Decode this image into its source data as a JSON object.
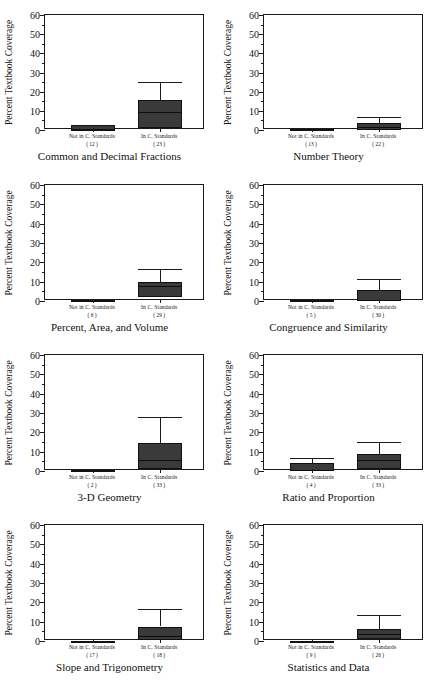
{
  "figure": {
    "axis_title_y": "Percent Textbook Coverage",
    "y_ticks": [
      0,
      10,
      20,
      30,
      40,
      50,
      60
    ],
    "y_min": 0,
    "y_max": 60,
    "category_labels": [
      "Not in C. Standards",
      "In C. Standards"
    ]
  },
  "chart_data": {
    "type": "box",
    "title": "",
    "xlabel": "",
    "ylabel": "Percent Textbook Coverage",
    "ylim": [
      0,
      60
    ],
    "ytick_values": [
      0,
      10,
      20,
      30,
      40,
      50,
      60
    ],
    "minor_tick_step": 5,
    "grid": false,
    "legend": "none",
    "categories": [
      "Not in C. Standards",
      "In C. Standards"
    ],
    "panels": [
      {
        "title": "Common and Decimal Fractions",
        "boxes": [
          {
            "category": "Not in C. Standards",
            "count_label": "( 12 )",
            "n": 12,
            "whisker_low": 0,
            "q1": 0,
            "median": 0,
            "q3": 2.5,
            "whisker_high": 2.5
          },
          {
            "category": "In C. Standards",
            "count_label": "( 23 )",
            "n": 23,
            "whisker_low": 0,
            "q1": 1,
            "median": 9.5,
            "q3": 15.5,
            "whisker_high": 25
          }
        ]
      },
      {
        "title": "Number Theory",
        "boxes": [
          {
            "category": "Not in C. Standards",
            "count_label": "( 13 )",
            "n": 13,
            "whisker_low": 0,
            "q1": 0,
            "median": 0,
            "q3": 0.5,
            "whisker_high": 0.5
          },
          {
            "category": "In C. Standards",
            "count_label": "( 22 )",
            "n": 22,
            "whisker_low": 0,
            "q1": 0,
            "median": 1.5,
            "q3": 3.5,
            "whisker_high": 7
          }
        ]
      },
      {
        "title": "Percent, Area, and Volume",
        "boxes": [
          {
            "category": "Not in C. Standards",
            "count_label": "( 6 )",
            "n": 6,
            "whisker_low": 0,
            "q1": 0,
            "median": 0,
            "q3": 0.6,
            "whisker_high": 0.6
          },
          {
            "category": "In C. Standards",
            "count_label": "( 29 )",
            "n": 29,
            "whisker_low": 0,
            "q1": 2,
            "median": 8,
            "q3": 10,
            "whisker_high": 16.5
          }
        ]
      },
      {
        "title": "Congruence and Similarity",
        "boxes": [
          {
            "category": "Not in C. Standards",
            "count_label": "( 5 )",
            "n": 5,
            "whisker_low": 0,
            "q1": 0,
            "median": 0,
            "q3": 0.4,
            "whisker_high": 0.4
          },
          {
            "category": "In C. Standards",
            "count_label": "( 30 )",
            "n": 30,
            "whisker_low": 0,
            "q1": 0,
            "median": 0.5,
            "q3": 5.5,
            "whisker_high": 11.5
          }
        ]
      },
      {
        "title": "3-D Geometry",
        "boxes": [
          {
            "category": "Not in C. Standards",
            "count_label": "( 2 )",
            "n": 2,
            "whisker_low": 0,
            "q1": 0,
            "median": 0,
            "q3": 0.6,
            "whisker_high": 0.6
          },
          {
            "category": "In C. Standards",
            "count_label": "( 33 )",
            "n": 33,
            "whisker_low": 0,
            "q1": 1,
            "median": 5.5,
            "q3": 14.5,
            "whisker_high": 28
          }
        ]
      },
      {
        "title": "Ratio and Proportion",
        "boxes": [
          {
            "category": "Not in C. Standards",
            "count_label": "( 4 )",
            "n": 4,
            "whisker_low": 0,
            "q1": 0,
            "median": 0.5,
            "q3": 4,
            "whisker_high": 6.5
          },
          {
            "category": "In C. Standards",
            "count_label": "( 33 )",
            "n": 33,
            "whisker_low": 0,
            "q1": 1,
            "median": 5.5,
            "q3": 9,
            "whisker_high": 15
          }
        ]
      },
      {
        "title": "Slope and Trigonometry",
        "boxes": [
          {
            "category": "Not in C. Standards",
            "count_label": "( 17 )",
            "n": 17,
            "whisker_low": 0,
            "q1": 0,
            "median": 0,
            "q3": 0,
            "whisker_high": 0
          },
          {
            "category": "In C. Standards",
            "count_label": "( 18 )",
            "n": 18,
            "whisker_low": 0,
            "q1": 0.5,
            "median": 2.5,
            "q3": 7.5,
            "whisker_high": 16.5
          }
        ]
      },
      {
        "title": "Statistics and Data",
        "boxes": [
          {
            "category": "Not in C. Standards",
            "count_label": "( 9 )",
            "n": 9,
            "whisker_low": 0,
            "q1": 0,
            "median": 0,
            "q3": 0,
            "whisker_high": 0
          },
          {
            "category": "In C. Standards",
            "count_label": "( 26 )",
            "n": 26,
            "whisker_low": 0,
            "q1": 1,
            "median": 3.5,
            "q3": 6,
            "whisker_high": 13.5
          }
        ]
      }
    ]
  }
}
